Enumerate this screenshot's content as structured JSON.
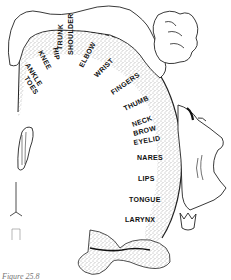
{
  "diagram": {
    "type": "motor homunculus",
    "labels": [
      {
        "text": "KNEE",
        "x": 38,
        "y": 52,
        "rot": 62
      },
      {
        "text": "HIP",
        "x": 53,
        "y": 48,
        "rot": 80
      },
      {
        "text": "ANKLE",
        "x": 25,
        "y": 65,
        "rot": 58
      },
      {
        "text": "TOES",
        "x": 24,
        "y": 78,
        "rot": 58
      },
      {
        "text": "TRUNK",
        "x": 62,
        "y": 50,
        "rot": -88
      },
      {
        "text": "SHOULDER",
        "x": 73,
        "y": 55,
        "rot": -90
      },
      {
        "text": "ELBOW",
        "x": 83,
        "y": 68,
        "rot": -62
      },
      {
        "text": "WRIST",
        "x": 97,
        "y": 78,
        "rot": -45
      },
      {
        "text": "FINGERS",
        "x": 113,
        "y": 95,
        "rot": -35
      },
      {
        "text": "THUMB",
        "x": 125,
        "y": 111,
        "rot": -25
      },
      {
        "text": "NECK",
        "x": 133,
        "y": 127,
        "rot": -20
      },
      {
        "text": "BROW",
        "x": 134,
        "y": 136,
        "rot": -15
      },
      {
        "text": "EYELID",
        "x": 134,
        "y": 145,
        "rot": -10
      },
      {
        "text": "NARES",
        "x": 137,
        "y": 160,
        "rot": 0
      },
      {
        "text": "LIPS",
        "x": 138,
        "y": 181,
        "rot": 0
      },
      {
        "text": "TONGUE",
        "x": 129,
        "y": 202,
        "rot": 0
      },
      {
        "text": "LARYNX",
        "x": 125,
        "y": 222,
        "rot": 0
      }
    ],
    "caption": "Figure 25.8"
  }
}
